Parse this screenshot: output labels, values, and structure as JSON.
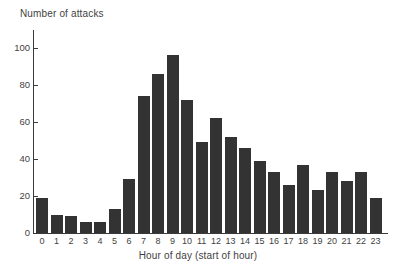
{
  "chart_data": {
    "type": "bar",
    "title": "",
    "xlabel": "Hour of day (start of hour)",
    "ylabel": "Number of attacks",
    "categories": [
      "0",
      "1",
      "2",
      "3",
      "4",
      "5",
      "6",
      "7",
      "8",
      "9",
      "10",
      "11",
      "12",
      "13",
      "14",
      "15",
      "16",
      "17",
      "18",
      "19",
      "20",
      "21",
      "22",
      "23"
    ],
    "values": [
      19,
      10,
      9,
      6,
      6,
      13,
      29,
      74,
      86,
      96,
      72,
      49,
      62,
      52,
      46,
      39,
      33,
      26,
      37,
      23,
      33,
      28,
      33,
      19
    ],
    "ylim": [
      0,
      105
    ],
    "yticks": [
      0,
      20,
      40,
      60,
      80,
      100
    ],
    "ytick_labels": [
      "0",
      "20",
      "40",
      "60",
      "80",
      "100"
    ],
    "grid": false,
    "legend": null,
    "bar_color": "#333333",
    "axis_color": "#3a3a3a",
    "background": "#ffffff"
  }
}
